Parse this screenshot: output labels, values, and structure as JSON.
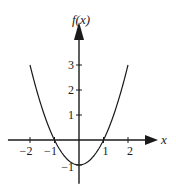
{
  "chart_data": {
    "type": "line",
    "title": "",
    "xlabel": "x",
    "ylabel": "f(x)",
    "function": "x^2 - 1",
    "series": [
      {
        "name": "f(x)",
        "x": [
          -2,
          -1.5,
          -1,
          -0.5,
          0,
          0.5,
          1,
          1.5,
          2
        ],
        "y": [
          3,
          1.25,
          0,
          -0.75,
          -1,
          -0.75,
          0,
          1.25,
          3
        ]
      }
    ],
    "xlim": [
      -2.9,
      3.2
    ],
    "ylim": [
      -1.75,
      4.7
    ],
    "x_ticks": [
      -2,
      -1,
      1,
      2
    ],
    "x_tick_labels": [
      "−2",
      "−1",
      "1",
      "2"
    ],
    "y_ticks": [
      -1,
      1,
      2,
      3
    ],
    "y_tick_labels": [
      "−1",
      "1",
      "2",
      "3"
    ],
    "grid": false,
    "legend": "none"
  }
}
